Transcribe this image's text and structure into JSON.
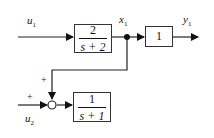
{
  "diagram": {
    "type": "block-diagram",
    "signals": {
      "u1": {
        "name": "u",
        "sub": "1"
      },
      "u2": {
        "name": "u",
        "sub": "2"
      },
      "x1": {
        "name": "x",
        "sub": "1"
      },
      "y1": {
        "name": "y",
        "sub": "1"
      }
    },
    "blocks": [
      {
        "id": "G1",
        "numerator": "2",
        "denominator": "s + 2"
      },
      {
        "id": "K",
        "gain": "1"
      },
      {
        "id": "G2",
        "numerator": "1",
        "denominator": "s + 1"
      }
    ],
    "summing_junction": {
      "signs": [
        "+",
        "+"
      ]
    }
  }
}
